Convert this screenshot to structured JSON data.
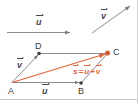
{
  "figure": {
    "type": "vector-addition-parallelogram",
    "width": 138,
    "height": 104,
    "background": "#ffffff",
    "colors": {
      "line_gray": "#8b8b93",
      "line_dark": "#6d6d76",
      "sum_orange": "#e2663a",
      "text_dark": "#3a3a3a",
      "text_vector": "#4a4a55",
      "footer_rule": "#c9c9cd",
      "edge_rule": "#c9c9cd"
    }
  },
  "legend": {
    "u_vector": {
      "label": "u",
      "accent": "arrow",
      "description": "reference vector u drawn horizontally at top-left"
    },
    "v_vector": {
      "label": "v",
      "accent": "arrow",
      "description": "reference vector v drawn diagonally at top-right"
    }
  },
  "diagram": {
    "points": [
      {
        "name": "A",
        "label": "A",
        "x": 12,
        "y": 84,
        "dot": false,
        "dot_color": ""
      },
      {
        "name": "B",
        "label": "B",
        "x": 81,
        "y": 84,
        "dot": true,
        "dot_color": "#3a3a3a"
      },
      {
        "name": "C",
        "label": "C",
        "x": 108,
        "y": 52,
        "dot": true,
        "dot_color": "#e2663a"
      },
      {
        "name": "D",
        "label": "D",
        "x": 39,
        "y": 52,
        "dot": true,
        "dot_color": "#3a3a3a"
      }
    ],
    "edges": [
      {
        "name": "A-to-B",
        "label": "u",
        "color": "#8b8b93",
        "arrow": true
      },
      {
        "name": "A-to-D",
        "label": "v",
        "color": "#8b8b93",
        "arrow": true
      },
      {
        "name": "D-to-C",
        "label": "",
        "color": "#8b8b93",
        "arrow": false
      },
      {
        "name": "B-to-C",
        "label": "",
        "color": "#8b8b93",
        "arrow": false
      },
      {
        "name": "A-to-C",
        "label": "s",
        "color": "#e2663a",
        "arrow": true
      }
    ],
    "labels": {
      "edge_u": "u",
      "edge_v": "v",
      "sum_s": "s",
      "sum_equals": "=",
      "sum_u": "u",
      "sum_plus": "+",
      "sum_v": "v"
    },
    "equation_text": "s = u + v"
  }
}
